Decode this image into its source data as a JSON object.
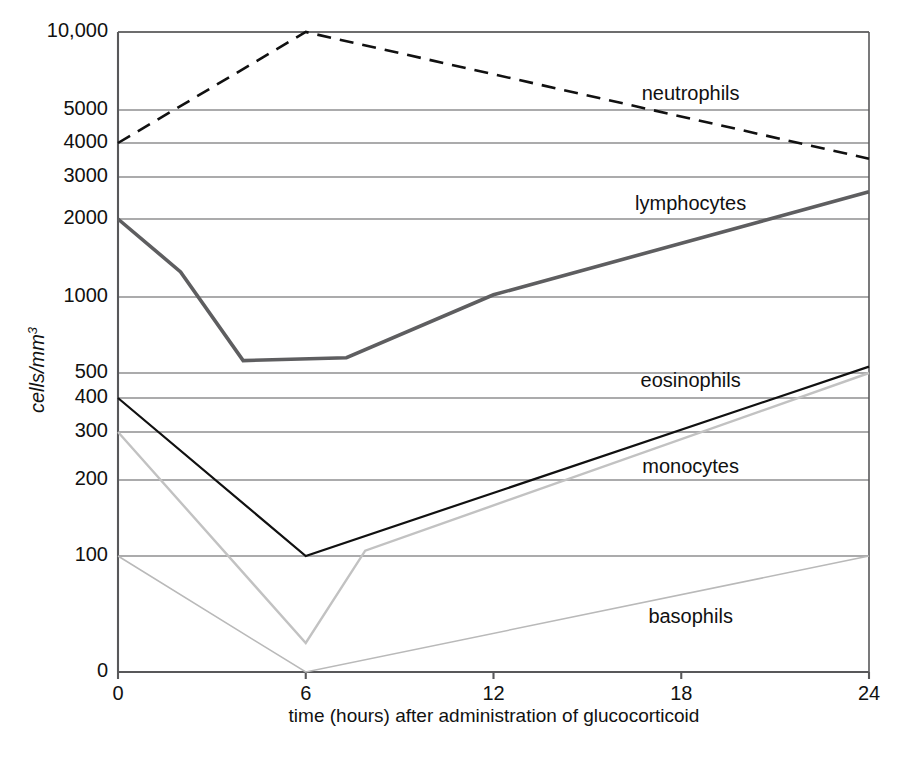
{
  "chart_data": {
    "type": "line",
    "title": "",
    "xlabel": "time (hours) after administration of glucocorticoid",
    "ylabel": "cells/mm3",
    "ylabel_display": "cells/mm",
    "ylabel_sup": "3",
    "x_ticks": [
      0,
      6,
      12,
      18,
      24
    ],
    "x_tick_labels": [
      "0",
      "6",
      "12",
      "18",
      "24"
    ],
    "xlim": [
      0,
      24
    ],
    "y_ticks": [
      0,
      100,
      200,
      300,
      400,
      500,
      1000,
      2000,
      3000,
      4000,
      5000,
      10000
    ],
    "y_tick_labels": [
      "0",
      "100",
      "200",
      "300",
      "400",
      "500",
      "1000",
      "2000",
      "3000",
      "4000",
      "5000",
      "10,000"
    ],
    "ylim": [
      0,
      10000
    ],
    "y_scale": "log-like piecewise (0 at baseline, log above 100)",
    "grid": true,
    "legend_position": "inline-right-labels",
    "series": [
      {
        "name": "neutrophils",
        "label": "neutrophils",
        "color": "#111111",
        "style": "dashed",
        "width": 2.6,
        "label_x": 18.3,
        "label_y_px": 95,
        "points": [
          {
            "x": 0,
            "y": 4000
          },
          {
            "x": 6,
            "y": 10000
          },
          {
            "x": 24,
            "y": 3500
          }
        ]
      },
      {
        "name": "lymphocytes",
        "label": "lymphocytes",
        "color": "#5e5e60",
        "style": "solid",
        "width": 3.6,
        "label_x": 18.3,
        "label_y_px": 205,
        "points": [
          {
            "x": 0,
            "y": 2000
          },
          {
            "x": 2,
            "y": 1250
          },
          {
            "x": 4,
            "y": 560
          },
          {
            "x": 7.3,
            "y": 575
          },
          {
            "x": 12,
            "y": 1020
          },
          {
            "x": 24,
            "y": 2600
          }
        ]
      },
      {
        "name": "eosinophils",
        "label": "eosinophils",
        "color": "#111111",
        "style": "solid",
        "width": 2.2,
        "label_x": 18.3,
        "label_y_px": 382,
        "points": [
          {
            "x": 0,
            "y": 400
          },
          {
            "x": 6,
            "y": 100
          },
          {
            "x": 24,
            "y": 530
          }
        ]
      },
      {
        "name": "monocytes",
        "label": "monocytes",
        "color": "#c2c2c2",
        "style": "solid",
        "width": 2.4,
        "label_x": 18.3,
        "label_y_px": 468,
        "points": [
          {
            "x": 0,
            "y": 300
          },
          {
            "x": 6,
            "y": 25
          },
          {
            "x": 7.9,
            "y": 105
          },
          {
            "x": 24,
            "y": 500
          }
        ]
      },
      {
        "name": "basophils",
        "label": "basophils",
        "color": "#b9b9b9",
        "style": "solid",
        "width": 1.5,
        "label_x": 18.3,
        "label_y_px": 618,
        "points": [
          {
            "x": 0,
            "y": 100
          },
          {
            "x": 6,
            "y": 0
          },
          {
            "x": 24,
            "y": 100
          }
        ]
      }
    ]
  }
}
